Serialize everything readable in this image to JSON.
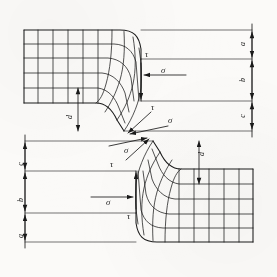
{
  "figure": {
    "type": "engineering-diagram",
    "background_color": "#fbfaf8",
    "line_color": "#1a1a1a",
    "width": 277,
    "height": 277
  },
  "top_figure": {
    "name": "upper-flow-net",
    "description": "Flow-net of stress trajectories curving into a concave fillet, rectangular grid at left",
    "dimensions": [
      {
        "label": "a",
        "position": "right",
        "order": 1
      },
      {
        "label": "b",
        "position": "right",
        "order": 2
      },
      {
        "label": "c",
        "position": "right",
        "order": 3
      },
      {
        "label": "d",
        "position": "interior-vertical",
        "order": 4
      }
    ],
    "stress_labels": [
      {
        "symbol": "τ",
        "name": "shear-stress",
        "location": "fillet-top-vertical"
      },
      {
        "symbol": "σ",
        "name": "normal-stress",
        "location": "horizontal-arrow-mid"
      },
      {
        "symbol": "τ",
        "name": "shear-stress",
        "location": "inclined-toe-upper"
      },
      {
        "symbol": "σ",
        "name": "normal-stress",
        "location": "inclined-toe-lower"
      }
    ]
  },
  "bottom_figure": {
    "name": "lower-flow-net",
    "description": "Mirror image of the upper flow-net, rotated 180 degrees",
    "dimensions": [
      {
        "label": "c",
        "position": "left",
        "order": 1
      },
      {
        "label": "b",
        "position": "left",
        "order": 2
      },
      {
        "label": "a",
        "position": "left",
        "order": 3
      },
      {
        "label": "d",
        "position": "interior-vertical",
        "order": 4
      }
    ],
    "stress_labels": [
      {
        "symbol": "σ",
        "name": "normal-stress",
        "location": "inclined-toe-upper"
      },
      {
        "symbol": "τ",
        "name": "shear-stress",
        "location": "inclined-toe-lower"
      },
      {
        "symbol": "σ",
        "name": "normal-stress",
        "location": "horizontal-arrow-mid"
      },
      {
        "symbol": "τ",
        "name": "shear-stress",
        "location": "fillet-bottom-vertical"
      }
    ]
  },
  "labels": {
    "a": "a",
    "b": "b",
    "c": "c",
    "d": "d",
    "sigma": "σ",
    "tau": "τ"
  }
}
